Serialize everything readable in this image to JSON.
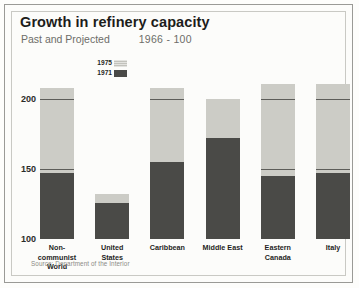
{
  "title": "Growth in refinery capacity",
  "subtitle_left": "Past and Projected",
  "subtitle_right": "1966 - 100",
  "source": "Source: Department of the Interior",
  "legend": {
    "items": [
      {
        "label": "1975",
        "color": "#ccccc6"
      },
      {
        "label": "1971",
        "color": "#4a4a47"
      }
    ]
  },
  "axis": {
    "ticks": [
      "200",
      "150",
      "100"
    ],
    "tick_values": [
      200,
      150,
      100
    ]
  },
  "chart_data": {
    "type": "bar",
    "title": "Growth in refinery capacity",
    "subtitle": "Past and Projected    1966 - 100",
    "xlabel": "",
    "ylabel": "",
    "ylim": [
      100,
      215
    ],
    "grid": false,
    "stacked": "overlaid",
    "legend_position": "top-left-inner",
    "categories": [
      "Non-communist\nWorld",
      "United\nStates",
      "Caribbean",
      "Middle East",
      "Eastern\nCanada",
      "Italy"
    ],
    "series": [
      {
        "name": "1975",
        "color": "#ccccc6",
        "values": [
          208,
          132,
          208,
          200,
          211,
          211
        ]
      },
      {
        "name": "1971",
        "color": "#4a4a47",
        "values": [
          147,
          126,
          155,
          172,
          145,
          147
        ]
      }
    ],
    "annotations": [
      "Source: Department of the Interior"
    ]
  },
  "bars": [
    {
      "label": "Non-communist\nWorld",
      "late": 208,
      "early": 147
    },
    {
      "label": "United\nStates",
      "late": 132,
      "early": 126
    },
    {
      "label": "Caribbean",
      "late": 208,
      "early": 155
    },
    {
      "label": "Middle East",
      "late": 200,
      "early": 172
    },
    {
      "label": "Eastern\nCanada",
      "late": 211,
      "early": 145
    },
    {
      "label": "Italy",
      "late": 211,
      "early": 147
    }
  ]
}
